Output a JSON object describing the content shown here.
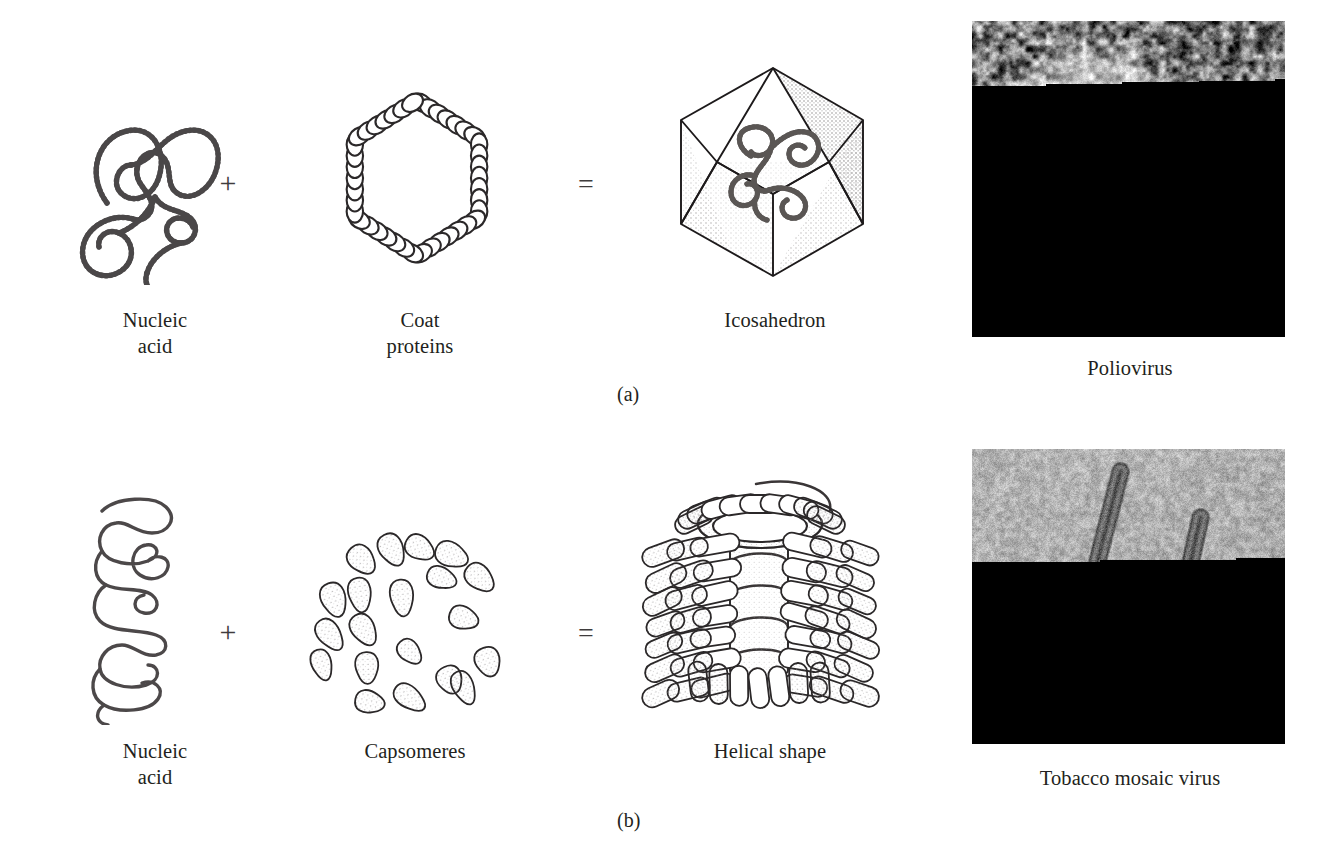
{
  "figure": {
    "panels": [
      {
        "letter": "(a)",
        "type": "icosahedral",
        "components": [
          {
            "name": "nucleic-acid",
            "label": "Nucleic\nacid"
          },
          {
            "name": "coat-proteins",
            "label": "Coat\nproteins"
          },
          {
            "name": "icosahedron",
            "label": "Icosahedron"
          }
        ],
        "operators": {
          "plus": "+",
          "equals": "="
        },
        "micrograph": {
          "name": "poliovirus-micrograph",
          "label": "Poliovirus"
        }
      },
      {
        "letter": "(b)",
        "type": "helical",
        "components": [
          {
            "name": "nucleic-acid",
            "label": "Nucleic\nacid"
          },
          {
            "name": "capsomeres",
            "label": "Capsomeres"
          },
          {
            "name": "helical-shape",
            "label": "Helical shape"
          }
        ],
        "operators": {
          "plus": "+",
          "equals": "="
        },
        "micrograph": {
          "name": "tmv-micrograph",
          "label": "Tobacco mosaic virus"
        }
      }
    ]
  },
  "labels": {
    "a": {
      "nucleic_acid": "Nucleic\nacid",
      "coat_proteins": "Coat\nproteins",
      "icosahedron": "Icosahedron",
      "poliovirus": "Poliovirus",
      "plus": "+",
      "equals": "=",
      "letter": "(a)"
    },
    "b": {
      "nucleic_acid": "Nucleic\nacid",
      "capsomeres": "Capsomeres",
      "helical_shape": "Helical shape",
      "tobacco_mosaic_virus": "Tobacco mosaic virus",
      "plus": "+",
      "equals": "=",
      "letter": "(b)"
    }
  },
  "colors": {
    "background": "#ffffff",
    "ink": "#231f20",
    "line": "#3f3c3d",
    "nucleic_acid_stroke": "#4a4748",
    "capsid_stroke": "#2b2829",
    "stipple": "#8d8a8b"
  }
}
